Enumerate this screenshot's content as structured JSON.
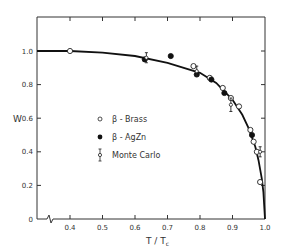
{
  "chart_data": {
    "type": "scatter",
    "title": "",
    "xlabel": "T / T_c",
    "ylabel": "W",
    "xlim": [
      0.3,
      1.0
    ],
    "ylim": [
      0,
      1.2
    ],
    "x_ticks": [
      0.4,
      0.5,
      0.6,
      0.7,
      0.8,
      0.9,
      1.0
    ],
    "x_tick_labels": [
      "0.4",
      "0.5",
      "0.6",
      "0.7",
      "0.8",
      "0.9",
      "1.0"
    ],
    "y_ticks": [
      0,
      0.2,
      0.4,
      0.6,
      0.8,
      1.0
    ],
    "y_tick_labels": [
      "0",
      "0.2",
      "0.4",
      "0.6",
      "0.8",
      "1.0"
    ],
    "axis_break": "x-axis break between 0 and 0.4",
    "grid": false,
    "legend_position": "center-left inside plot",
    "series": [
      {
        "name": "β - Brass",
        "marker": "open-circle",
        "points": [
          {
            "x": 0.4,
            "y": 1.0
          },
          {
            "x": 0.78,
            "y": 0.91
          },
          {
            "x": 0.83,
            "y": 0.84
          },
          {
            "x": 0.87,
            "y": 0.78
          },
          {
            "x": 0.895,
            "y": 0.72
          },
          {
            "x": 0.92,
            "y": 0.67
          },
          {
            "x": 0.955,
            "y": 0.53
          },
          {
            "x": 0.965,
            "y": 0.46
          },
          {
            "x": 0.975,
            "y": 0.4
          },
          {
            "x": 0.985,
            "y": 0.22
          }
        ]
      },
      {
        "name": "β - AgZn",
        "marker": "filled-circle",
        "points": [
          {
            "x": 0.63,
            "y": 0.95
          },
          {
            "x": 0.71,
            "y": 0.97
          },
          {
            "x": 0.79,
            "y": 0.86
          },
          {
            "x": 0.835,
            "y": 0.83
          },
          {
            "x": 0.875,
            "y": 0.75
          },
          {
            "x": 0.96,
            "y": 0.5
          }
        ]
      },
      {
        "name": "Monte Carlo",
        "marker": "open-circle-errorbar",
        "points": [
          {
            "x": 0.635,
            "y": 0.96,
            "err": 0.03
          },
          {
            "x": 0.79,
            "y": 0.88,
            "err": 0.03
          },
          {
            "x": 0.895,
            "y": 0.68,
            "err": 0.04
          },
          {
            "x": 0.985,
            "y": 0.4,
            "err": 0.03
          }
        ]
      },
      {
        "name": "theory curve",
        "marker": "line",
        "points": [
          {
            "x": 0.3,
            "y": 1.0
          },
          {
            "x": 0.4,
            "y": 1.0
          },
          {
            "x": 0.5,
            "y": 0.99
          },
          {
            "x": 0.6,
            "y": 0.97
          },
          {
            "x": 0.7,
            "y": 0.93
          },
          {
            "x": 0.8,
            "y": 0.87
          },
          {
            "x": 0.85,
            "y": 0.81
          },
          {
            "x": 0.9,
            "y": 0.71
          },
          {
            "x": 0.93,
            "y": 0.62
          },
          {
            "x": 0.95,
            "y": 0.54
          },
          {
            "x": 0.97,
            "y": 0.43
          },
          {
            "x": 0.98,
            "y": 0.35
          },
          {
            "x": 0.99,
            "y": 0.24
          },
          {
            "x": 0.995,
            "y": 0.16
          },
          {
            "x": 1.0,
            "y": 0.0
          }
        ]
      }
    ],
    "legend": [
      {
        "symbol": "○",
        "label": "β - Brass"
      },
      {
        "symbol": "●",
        "label": "β - AgZn"
      },
      {
        "symbol": "Ï",
        "label": "Monte Carlo"
      }
    ]
  },
  "labels": {
    "ylabel": "W",
    "xlabel_main": "T / T",
    "xlabel_sub": "c",
    "legend_0": "β - Brass",
    "legend_1": "β - AgZn",
    "legend_2": "Monte Carlo"
  }
}
